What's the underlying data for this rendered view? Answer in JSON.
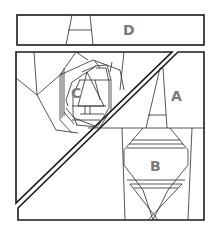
{
  "diagram": {
    "type": "paper-piecing pattern",
    "stroke_color": "#1a1a1a",
    "label_color": "#7a7a7a",
    "background": "#ffffff",
    "sections": [
      {
        "id": "D",
        "label": "D",
        "shape": "horizontal strip at top"
      },
      {
        "id": "C",
        "label": "C",
        "shape": "upper-left triangle with spiral rose"
      },
      {
        "id": "A",
        "label": "A",
        "shape": "upper-right area with tapered column"
      },
      {
        "id": "B",
        "label": "B",
        "shape": "lower-right area with diamond/lens shape"
      }
    ]
  }
}
